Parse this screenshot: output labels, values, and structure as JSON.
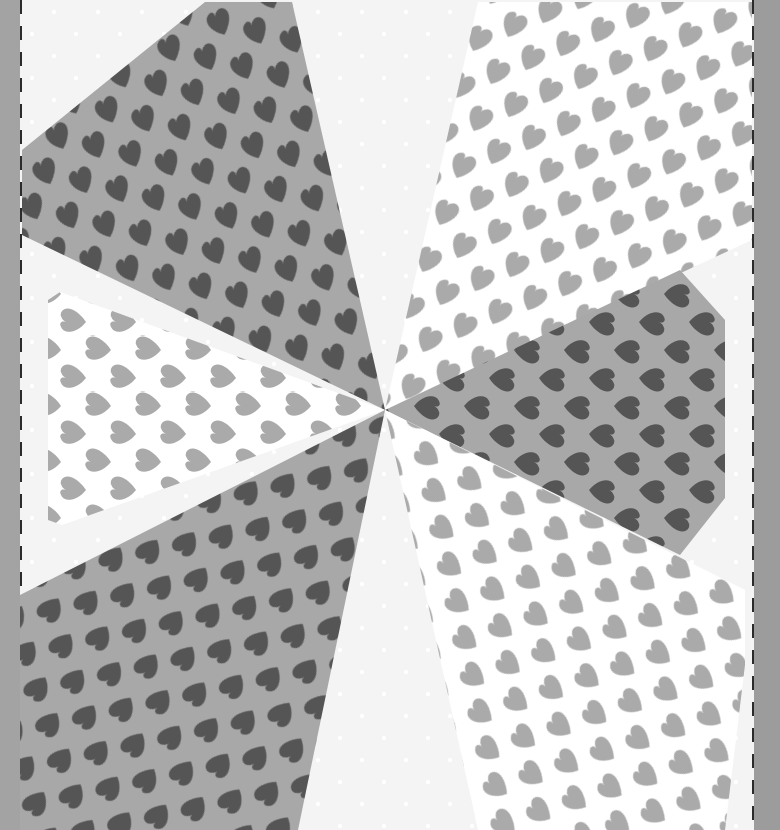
{
  "image": {
    "description": "Grayscale photo of a kaleidoscope/pinwheel quilt block made of heart-print fabric wedges on a white dotted background, with dashed cut lines on both sides",
    "center": [
      385,
      410
    ],
    "colors": {
      "frame": "#a3a3a3",
      "background": "#f4f4f4",
      "dash": "#2b2b2b",
      "dark_fabric_ground": "#a8a8a8",
      "dark_fabric_heart": "#555555",
      "light_fabric_ground": "#ffffff",
      "light_fabric_heart": "#aaaaaa"
    },
    "wedges": [
      {
        "name": "top-left",
        "fabric": "dark",
        "points": "385,410 22,235 22,150 205,2 292,2"
      },
      {
        "name": "left",
        "fabric": "light",
        "points": "385,410 60,292 48,300 48,520 62,525"
      },
      {
        "name": "bottom-left",
        "fabric": "dark",
        "points": "385,410 20,595 20,830 298,830"
      },
      {
        "name": "top-right",
        "fabric": "light",
        "points": "385,410 478,2 548,2 752,2 752,240"
      },
      {
        "name": "right",
        "fabric": "dark",
        "points": "385,410 680,270 725,320 725,498 680,555"
      },
      {
        "name": "bottom-right",
        "fabric": "light",
        "points": "385,410 745,590 745,665 725,830 478,830"
      }
    ]
  }
}
